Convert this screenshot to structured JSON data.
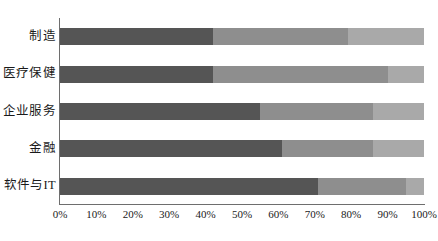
{
  "chart_data": {
    "type": "bar",
    "orientation": "horizontal",
    "stacked": true,
    "stacked_normalized": true,
    "title": "",
    "subtitle": "",
    "xlabel": "",
    "ylabel": "",
    "xlim": [
      0,
      100
    ],
    "grid": false,
    "legend": "none",
    "axis_tick_format": "percent",
    "categories": [
      "制造",
      "医疗保健",
      "企业服务",
      "金融",
      "软件与IT"
    ],
    "x_tick_labels": [
      "0%",
      "10%",
      "20%",
      "30%",
      "40%",
      "50%",
      "60%",
      "70%",
      "80%",
      "90%",
      "100%"
    ],
    "x_tick_values": [
      0,
      10,
      20,
      30,
      40,
      50,
      60,
      70,
      80,
      90,
      100
    ],
    "series": [
      {
        "name": "segment-1",
        "color": "#555555",
        "values": [
          42,
          42,
          55,
          61,
          71
        ]
      },
      {
        "name": "segment-2",
        "color": "#8e8e8e",
        "values": [
          37,
          48,
          31,
          25,
          24
        ]
      },
      {
        "name": "segment-3",
        "color": "#a9a9a9",
        "values": [
          21,
          10,
          14,
          14,
          5
        ]
      }
    ],
    "rows": [
      {
        "category": "制造",
        "segments": [
          42,
          37,
          21
        ]
      },
      {
        "category": "医疗保健",
        "segments": [
          42,
          48,
          10
        ]
      },
      {
        "category": "企业服务",
        "segments": [
          55,
          31,
          14
        ]
      },
      {
        "category": "金融",
        "segments": [
          61,
          25,
          14
        ]
      },
      {
        "category": "软件与IT",
        "segments": [
          71,
          24,
          5
        ]
      }
    ]
  },
  "colors": {
    "segment_1": "#555555",
    "segment_2": "#8e8e8e",
    "segment_3": "#a9a9a9",
    "axis": "#6e6e6e",
    "text": "#1a1a1a",
    "background": "#ffffff"
  }
}
